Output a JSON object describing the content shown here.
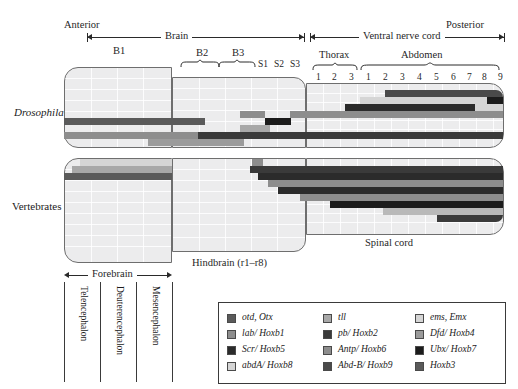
{
  "figure": {
    "anterior_label": "Anterior",
    "posterior_label": "Posterior"
  },
  "axes": {
    "top_ranges": [
      {
        "name": "brain",
        "label": "Brain"
      },
      {
        "name": "ventral-nerve-cord",
        "label": "Ventral nerve cord"
      }
    ],
    "bottom_ranges": [
      {
        "name": "forebrain",
        "label": "Forebrain"
      }
    ]
  },
  "drosophila": {
    "organism_label": "Drosophila",
    "neuromere_groups": [
      {
        "label": "B1"
      },
      {
        "label": "B2"
      },
      {
        "label": "B3"
      },
      {
        "label": "Thorax"
      },
      {
        "label": "Abdomen"
      }
    ],
    "single_segments": [
      {
        "label": "S1"
      },
      {
        "label": "S2"
      },
      {
        "label": "S3"
      }
    ],
    "thorax_segments": [
      "1",
      "2",
      "3"
    ],
    "abdomen_segments": [
      "1",
      "2",
      "3",
      "4",
      "5",
      "6",
      "7",
      "8",
      "9"
    ]
  },
  "vertebrates": {
    "organism_label": "Vertebrates",
    "regions": [
      {
        "label": "Hindbrain (r1–r8)"
      },
      {
        "label": "Spinal cord"
      }
    ],
    "forebrain_parts": [
      {
        "label": "Telencephalon"
      },
      {
        "label": "Deuterencephalon"
      },
      {
        "label": "Mesencephalon"
      }
    ]
  },
  "legend": {
    "columns": [
      {
        "name": "legend-column-1",
        "entries": [
          {
            "label": "otd, Otx",
            "color": "#5a5a5a"
          },
          {
            "label": "lab/ Hoxb1",
            "color": "#8d8d8d"
          },
          {
            "label": "Scr/ Hoxb5",
            "color": "#2b2b2b"
          },
          {
            "label": "abdA/ Hoxb8",
            "color": "#d5d5d5"
          }
        ]
      },
      {
        "name": "legend-column-2",
        "entries": [
          {
            "label": "tll",
            "color": "#a8a8a8"
          },
          {
            "label": "pb/ Hoxb2",
            "color": "#3a3a3a"
          },
          {
            "label": "Antp/ Hoxb6",
            "color": "#8d8d8d"
          },
          {
            "label": "Abd-B/ Hoxb9",
            "color": "#4a4a4a"
          }
        ]
      },
      {
        "name": "legend-column-3",
        "entries": [
          {
            "label": "ems, Emx",
            "color": "#d5d5d5"
          },
          {
            "label": "Dfd/ Hoxb4",
            "color": "#9b9b9b"
          },
          {
            "label": "Ubx/ Hoxb7",
            "color": "#1c1c1c"
          },
          {
            "label": "Hoxb3",
            "color": "#5a5a5a"
          }
        ]
      }
    ]
  },
  "chart_data": {
    "type": "bar",
    "xlabel": "Anteroposterior position (neuromere / segment)",
    "ylabel": "Gene",
    "xlim": [
      60,
      500
    ],
    "grid": false,
    "legend_position": "bottom",
    "panels": [
      {
        "name": "Drosophila",
        "bars": [
          {
            "gene": "ems, Emx",
            "color": "#d5d5d5",
            "x0": 67,
            "x1": 293,
            "y": 92,
            "note": "B1 broad anterior domain"
          },
          {
            "gene": "Abd-B/ Hoxb9",
            "color": "#4a4a4a",
            "x0": 385,
            "x1": 500,
            "y": 92
          },
          {
            "gene": "abdA/ Hoxb8",
            "color": "#d5d5d5",
            "x0": 360,
            "x1": 487,
            "y": 99
          },
          {
            "gene": "Ubx/ Hoxb7",
            "color": "#1c1c1c",
            "x0": 345,
            "x1": 500,
            "y": 99
          },
          {
            "gene": "Antp/ Hoxb6",
            "color": "#2b2b2b",
            "x0": 326,
            "x1": 475,
            "y": 106
          },
          {
            "gene": "Scr/ Hoxb5",
            "color": "#8d8d8d",
            "x0": 290,
            "x1": 500,
            "y": 113
          },
          {
            "gene": "otd, Otx",
            "color": "#5a5a5a",
            "x0": 67,
            "x1": 205,
            "y": 120
          },
          {
            "gene": "Dfd/ Hoxb4",
            "color": "#1c1c1c",
            "x0": 265,
            "x1": 290,
            "y": 120
          },
          {
            "gene": "tll",
            "color": "#a8a8a8",
            "x0": 240,
            "x1": 270,
            "y": 127
          },
          {
            "gene": "lab/ Hoxb1",
            "color": "#8d8d8d",
            "x0": 67,
            "x1": 245,
            "y": 134
          },
          {
            "gene": "pb/ Hoxb2",
            "color": "#3a3a3a",
            "x0": 198,
            "x1": 500,
            "y": 134
          },
          {
            "gene": "Hoxb3",
            "color": "#9b9b9b",
            "x0": 148,
            "x1": 243,
            "y": 141
          }
        ]
      },
      {
        "name": "Vertebrates",
        "bars": [
          {
            "gene": "ems, Emx",
            "color": "#d5d5d5",
            "x0": 80,
            "x1": 148,
            "y": 163
          },
          {
            "gene": "tll",
            "color": "#a8a8a8",
            "x0": 72,
            "x1": 148,
            "y": 170
          },
          {
            "gene": "otd, Otx",
            "color": "#5a5a5a",
            "x0": 67,
            "x1": 148,
            "y": 177
          },
          {
            "gene": "lab/ Hoxb1",
            "color": "#8d8d8d",
            "x0": 252,
            "x1": 262,
            "y": 163
          },
          {
            "gene": "pb/ Hoxb2",
            "color": "#3a3a3a",
            "x0": 250,
            "x1": 500,
            "y": 170
          },
          {
            "gene": "Hoxb3",
            "color": "#2b2b2b",
            "x0": 258,
            "x1": 500,
            "y": 177
          },
          {
            "gene": "Dfd/ Hoxb4",
            "color": "#8d8d8d",
            "x0": 288,
            "x1": 500,
            "y": 184
          },
          {
            "gene": "Scr/ Hoxb5",
            "color": "#2b2b2b",
            "x0": 296,
            "x1": 500,
            "y": 191
          },
          {
            "gene": "Antp/ Hoxb6",
            "color": "#8d8d8d",
            "x0": 320,
            "x1": 500,
            "y": 198
          },
          {
            "gene": "Ubx/ Hoxb7",
            "color": "#1c1c1c",
            "x0": 345,
            "x1": 500,
            "y": 205
          },
          {
            "gene": "abdA/ Hoxb8",
            "color": "#b9b9b9",
            "x0": 390,
            "x1": 500,
            "y": 212
          },
          {
            "gene": "Abd-B/ Hoxb9",
            "color": "#3a3a3a",
            "x0": 437,
            "x1": 500,
            "y": 219
          }
        ]
      }
    ]
  }
}
